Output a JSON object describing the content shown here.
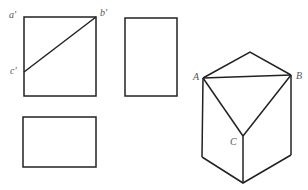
{
  "diagram": {
    "type": "orthographic-projection-with-isometric",
    "colors": {
      "line": "#222222",
      "label": "#555555",
      "background": "#ffffff"
    },
    "front_view": {
      "labels": {
        "a": "a'",
        "b": "b'",
        "c": "c'"
      }
    },
    "side_view": {},
    "top_view": {},
    "isometric": {
      "labels": {
        "A": "A",
        "B": "B",
        "C": "C"
      }
    }
  }
}
